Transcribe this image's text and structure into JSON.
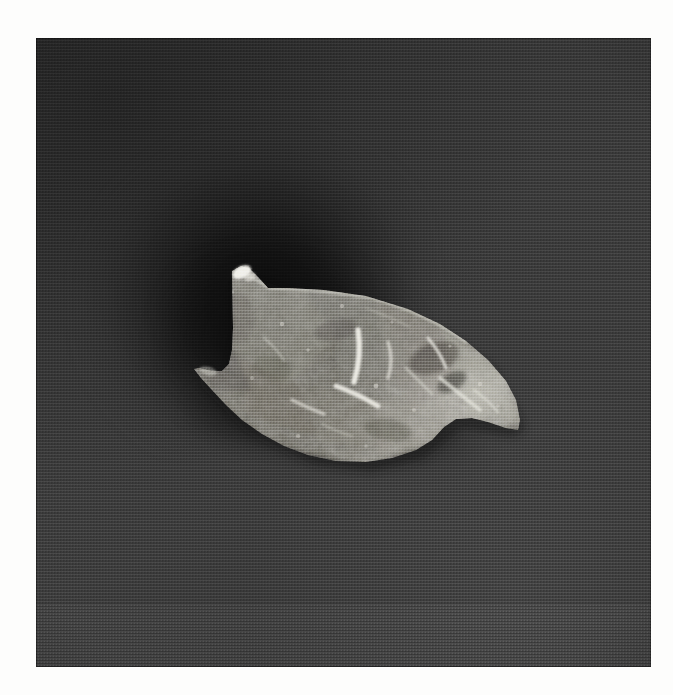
{
  "image": {
    "kind": "photograph",
    "subject": "lithic-artifact",
    "description": "Black and white photograph of a chipped stone projectile point resting on a dark grey background",
    "caption": "",
    "width": 673,
    "height": 695
  },
  "frame": {
    "border_color": "#fdfdfc",
    "border_left": 36,
    "border_top": 38,
    "plate_width": 615,
    "plate_height": 629
  },
  "background": {
    "base_color": "#464646",
    "shadow_color": "#0e0e0e",
    "highlight_color": "#5f5f5f",
    "texture": "halftone-screen"
  },
  "artifact": {
    "name": "stone-projectile-point",
    "material_tone": "#8f8d88",
    "shadow_tone": "#56544f",
    "highlight_tone": "#f2f1ec",
    "orientation": "tip-right",
    "outline_points": "196,233 205,228 214,231 222,239 232,250 252,250 288,252 330,258 372,271 404,286 430,303 452,322 470,343 480,362 484,382 482,392 470,390 452,384 436,380 420,381 408,389 396,402 380,412 356,420 330,424 300,423 272,417 248,408 226,396 206,382 190,367 176,352 165,340 158,331 163,330 175,333 186,333 193,326 196,312 197,290 196,262",
    "features": [
      {
        "name": "barb-tang-tip",
        "x": 199,
        "y": 233
      },
      {
        "name": "basal-notch",
        "x": 176,
        "y": 330
      },
      {
        "name": "lower-left-corner",
        "x": 157,
        "y": 330
      },
      {
        "name": "distal-point",
        "x": 484,
        "y": 382
      },
      {
        "name": "dorsal-ridge",
        "x": 330,
        "y": 320
      }
    ],
    "flake_scars": [
      {
        "name": "scar-ridge-1",
        "x": 318,
        "y": 296,
        "length": 62,
        "angle": -72
      },
      {
        "name": "scar-ridge-2",
        "x": 348,
        "y": 326,
        "length": 44,
        "angle": -58
      },
      {
        "name": "scar-ridge-3",
        "x": 300,
        "y": 352,
        "length": 52,
        "angle": -22
      },
      {
        "name": "scar-ridge-4",
        "x": 262,
        "y": 368,
        "length": 38,
        "angle": -18
      },
      {
        "name": "scar-ridge-5",
        "x": 396,
        "y": 318,
        "length": 34,
        "angle": -64
      },
      {
        "name": "scar-ridge-6",
        "x": 412,
        "y": 352,
        "length": 58,
        "angle": -44
      }
    ]
  }
}
